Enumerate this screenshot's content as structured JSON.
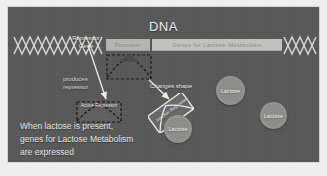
{
  "slide": {
    "title": "DNA",
    "background_color": "#595959",
    "page_background": "#eeeeec"
  },
  "dna": {
    "promoter_label": "Promoter",
    "genes_label": "Genes for Lactose Metabolism",
    "strand_color": "#d8d8d2",
    "bar_color": "#c4c4bf"
  },
  "labels": {
    "repressor_gene": "Repressor\nGene",
    "produces_repressor": "produces\nrepressor",
    "changes_shape": "Changes shape",
    "active_repressor": "Active Repressor",
    "inactive_repressor": "Inactive Repressor"
  },
  "molecules": [
    {
      "name": "Lactose"
    },
    {
      "name": "Lactose"
    },
    {
      "name": "Lactose"
    }
  ],
  "caption": {
    "text": "When lactose is present,\ngenes for Lactose Metabolism\nare expressed"
  }
}
